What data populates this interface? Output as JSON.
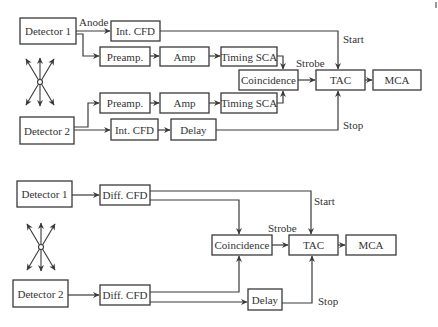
{
  "top_diagram": {
    "detector1": "Detector 1",
    "detector2": "Detector 2",
    "int_cfd_1": "Int. CFD",
    "int_cfd_2": "Int. CFD",
    "preamp_1": "Preamp.",
    "preamp_2": "Preamp.",
    "amp_1": "Amp",
    "amp_2": "Amp",
    "timing_sca_1": "Timing SCA",
    "timing_sca_2": "Timing SCA",
    "coincidence": "Coincidence",
    "tac": "TAC",
    "mca": "MCA",
    "delay": "Delay",
    "labels": {
      "anode": "Anode",
      "start": "Start",
      "strobe": "Strobe",
      "stop": "Stop"
    }
  },
  "bottom_diagram": {
    "detector1": "Detector 1",
    "detector2": "Detector 2",
    "diff_cfd_1": "Diff. CFD",
    "diff_cfd_2": "Diff. CFD",
    "coincidence": "Coincidence",
    "tac": "TAC",
    "mca": "MCA",
    "delay": "Delay",
    "labels": {
      "start": "Start",
      "strobe": "Strobe",
      "stop": "Stop"
    }
  }
}
